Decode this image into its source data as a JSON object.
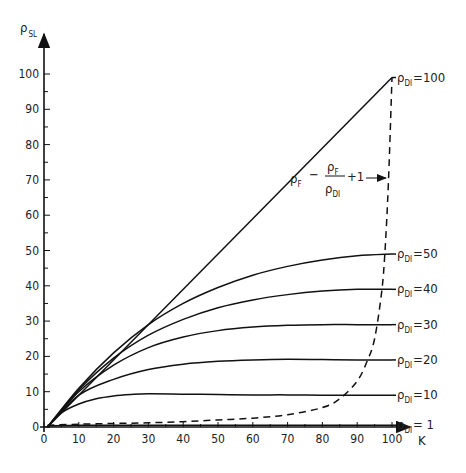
{
  "chart_data": {
    "type": "line",
    "title": "",
    "xlabel": "K",
    "ylabel": "ρSL",
    "xlim": [
      0,
      100
    ],
    "ylim": [
      0,
      100
    ],
    "x_ticks": [
      0,
      10,
      20,
      30,
      40,
      50,
      60,
      70,
      80,
      90,
      100
    ],
    "y_ticks": [
      0,
      10,
      20,
      30,
      40,
      50,
      60,
      70,
      80,
      90,
      100
    ],
    "grid": false,
    "annotation": "ρF − ρF/ρDI + 1",
    "series": [
      {
        "name": "ρDI = 1",
        "label_main": "ρ",
        "label_sub": "DI",
        "label_val": "= 1",
        "end_value": 0.5,
        "style": "solid",
        "x": [
          1,
          10,
          20,
          30,
          40,
          50,
          60,
          70,
          80,
          90,
          100
        ],
        "y": [
          0.3,
          0.5,
          0.5,
          0.5,
          0.5,
          0.5,
          0.5,
          0.5,
          0.5,
          0.5,
          0.5
        ]
      },
      {
        "name": "ρDI = 10",
        "label_main": "ρ",
        "label_sub": "DI",
        "label_val": "=10",
        "end_value": 9,
        "style": "solid",
        "x": [
          1,
          5,
          10,
          15,
          20,
          25,
          30,
          40,
          50,
          60,
          70,
          80,
          90,
          100
        ],
        "y": [
          0,
          4,
          6.5,
          8,
          8.8,
          9.2,
          9.4,
          9.3,
          9.2,
          9.1,
          9.1,
          9.0,
          9.0,
          9.0
        ]
      },
      {
        "name": "ρDI = 20",
        "label_main": "ρ",
        "label_sub": "DI",
        "label_val": "=20",
        "end_value": 19,
        "style": "solid",
        "x": [
          1,
          10,
          20,
          30,
          40,
          50,
          60,
          70,
          80,
          90,
          100
        ],
        "y": [
          0,
          9,
          13.5,
          16.3,
          17.8,
          18.6,
          19.0,
          19.2,
          19.1,
          19.0,
          19.0
        ]
      },
      {
        "name": "ρDI = 30",
        "label_main": "ρ",
        "label_sub": "DI",
        "label_val": "=30",
        "end_value": 29,
        "style": "solid",
        "x": [
          1,
          10,
          20,
          30,
          40,
          50,
          60,
          70,
          80,
          90,
          100
        ],
        "y": [
          0,
          10,
          17.5,
          22.5,
          25.5,
          27.3,
          28.3,
          28.8,
          29.0,
          29.0,
          29.0
        ]
      },
      {
        "name": "ρDI = 40",
        "label_main": "ρ",
        "label_sub": "DI",
        "label_val": "=40",
        "end_value": 39,
        "style": "solid",
        "x": [
          1,
          10,
          20,
          30,
          40,
          50,
          60,
          70,
          80,
          90,
          100
        ],
        "y": [
          0,
          10.5,
          19.5,
          26,
          30.5,
          33.8,
          36,
          37.5,
          38.5,
          39,
          39
        ]
      },
      {
        "name": "ρDI = 50",
        "label_main": "ρ",
        "label_sub": "DI",
        "label_val": "=50",
        "end_value": 49,
        "style": "solid",
        "x": [
          1,
          10,
          20,
          30,
          40,
          50,
          60,
          70,
          80,
          90,
          100
        ],
        "y": [
          0,
          11,
          21,
          29,
          35,
          39.5,
          43,
          45.5,
          47.3,
          48.5,
          49
        ]
      },
      {
        "name": "ρDI = 100",
        "label_main": "ρ",
        "label_sub": "DI",
        "label_val": "=100",
        "end_value": 99,
        "style": "solid",
        "x": [
          1,
          100
        ],
        "y": [
          0,
          99
        ]
      },
      {
        "name": "ρF − ρF/ρDI + 1 (locus)",
        "style": "dashed",
        "x": [
          1,
          10,
          20,
          30,
          40,
          50,
          60,
          70,
          80,
          85,
          90,
          93,
          95,
          97,
          98,
          99,
          100
        ],
        "y": [
          0.5,
          0.8,
          1.0,
          1.2,
          1.5,
          2.0,
          2.5,
          3.5,
          5.5,
          8,
          13,
          19,
          25,
          38,
          50,
          70,
          99
        ]
      }
    ]
  }
}
